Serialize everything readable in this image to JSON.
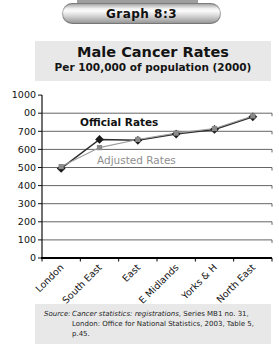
{
  "banner": {
    "label": "Graph 8:3"
  },
  "title": {
    "main": "Male Cancer Rates",
    "subtitle": "Per 100,000 of population (2000)"
  },
  "chart_data": {
    "type": "line",
    "title": "Male Cancer Rates",
    "subtitle": "Per 100,000 of population (2000)",
    "categories": [
      "London",
      "South East",
      "East",
      "E Midlands",
      "Yorks & H",
      "North East"
    ],
    "series": [
      {
        "name": "Official Rates",
        "values": [
          495,
          655,
          650,
          685,
          710,
          780
        ],
        "color": "#2d2d2d",
        "marker": "diamond",
        "marker_color": "#1a1a1a",
        "label": {
          "text": "Official Rates",
          "x": 80,
          "y": 126,
          "color": "#111111",
          "bold": true
        }
      },
      {
        "name": "Adjusted Rates",
        "values": [
          505,
          610,
          655,
          690,
          715,
          785
        ],
        "color": "#9c9c9c",
        "marker": "square",
        "marker_color": "#8a8a8a",
        "label": {
          "text": "Adjusted Rates",
          "x": 97,
          "y": 164,
          "color": "#8f8f8f",
          "bold": false
        }
      }
    ],
    "y_tick_labels": [
      "0",
      "100",
      "200",
      "300",
      "400",
      "500",
      "600",
      "700",
      "00",
      "1000"
    ],
    "ylim": [
      0,
      1000
    ],
    "xlabel": "",
    "ylabel": "",
    "grid": true,
    "legend_position": "inline-annotations"
  },
  "source": {
    "label": "Source:",
    "publication": "Cancer statistics: registrations",
    "details": ", Series MB1 no. 31, London: Office for National Statistics, 2003, Table 5, p.45."
  }
}
